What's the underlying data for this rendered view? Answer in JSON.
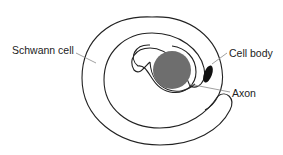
{
  "diagram": {
    "labels": {
      "schwann_cell": "Schwann cell",
      "cell_body": "Cell body",
      "axon": "Axon"
    },
    "colors": {
      "axon_fill": "#6e6e6e",
      "cell_body_fill": "#111111",
      "outline": "#222222",
      "leader_line": "#888888"
    }
  }
}
